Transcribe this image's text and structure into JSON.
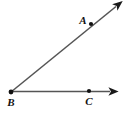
{
  "figure": {
    "kind": "geometry-diagram",
    "width": 124,
    "height": 117,
    "background_color": "#ffffff",
    "line_color": "#555555",
    "mark_color": "#111111",
    "label_color": "#111111"
  },
  "points": [
    {
      "id": "A",
      "label": "A",
      "dot_x": 91,
      "dot_y": 24,
      "label_x": 83,
      "label_y": 24,
      "dot_radius": 2.1
    },
    {
      "id": "B",
      "label": "B",
      "dot_x": 11,
      "dot_y": 92,
      "label_x": 11,
      "label_y": 106,
      "dot_radius": 2.4
    },
    {
      "id": "C",
      "label": "C",
      "dot_x": 89,
      "dot_y": 91,
      "label_x": 89,
      "label_y": 105,
      "dot_radius": 2.1
    }
  ],
  "rays": [
    {
      "id": "ray-BA",
      "from": "B",
      "through": "A",
      "x1": 11,
      "y1": 92,
      "x2": 118,
      "y2": 5,
      "has_arrowhead": true,
      "stroke_width": 1.6
    },
    {
      "id": "ray-BC",
      "from": "B",
      "through": "C",
      "x1": 11,
      "y1": 92,
      "x2": 112,
      "y2": 91,
      "has_arrowhead": true,
      "stroke_width": 1.6
    }
  ]
}
